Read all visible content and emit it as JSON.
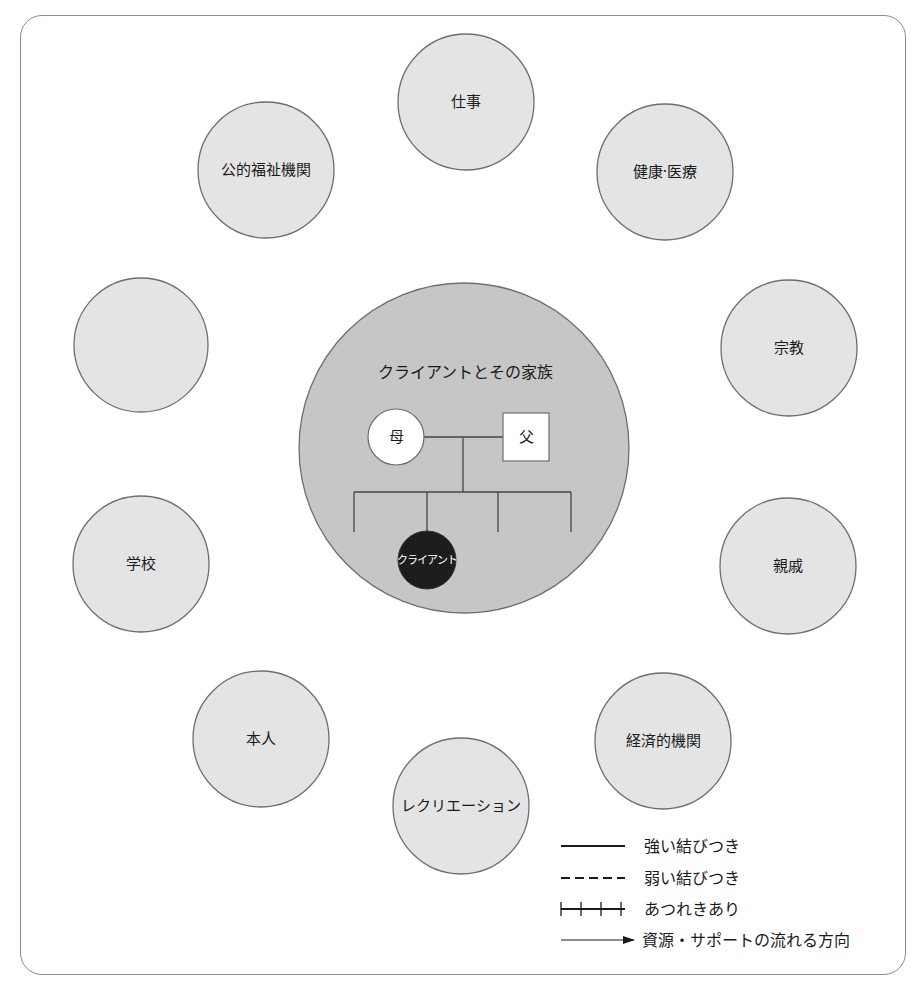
{
  "diagram": {
    "type": "ecomap",
    "colors": {
      "outer_node_fill": "#e4e4e4",
      "center_fill": "#c6c6c6",
      "stroke": "#6e6e6e",
      "client_fill": "#1c1c1c",
      "family_box_fill": "#ffffff"
    },
    "nodes": [
      {
        "id": "work",
        "label": "仕事",
        "cx": 466,
        "cy": 102,
        "r": 68
      },
      {
        "id": "health",
        "label": "健康·医療",
        "cx": 665,
        "cy": 172,
        "r": 68
      },
      {
        "id": "religion",
        "label": "宗教",
        "cx": 789,
        "cy": 348,
        "r": 68
      },
      {
        "id": "relatives",
        "label": "親戚",
        "cx": 788,
        "cy": 566,
        "r": 68
      },
      {
        "id": "economic",
        "label": "経済的機関",
        "cx": 663,
        "cy": 741,
        "r": 68
      },
      {
        "id": "recreation",
        "label": "レクリエーション",
        "cx": 461,
        "cy": 806,
        "r": 68
      },
      {
        "id": "self",
        "label": "本人",
        "cx": 261,
        "cy": 739,
        "r": 68
      },
      {
        "id": "school",
        "label": "学校",
        "cx": 141,
        "cy": 564,
        "r": 68
      },
      {
        "id": "empty",
        "label": "",
        "cx": 141,
        "cy": 345,
        "r": 67
      },
      {
        "id": "welfare",
        "label": "公的福祉機関",
        "cx": 266,
        "cy": 170,
        "r": 68
      }
    ],
    "center": {
      "title": "クライアントとその家族",
      "cx": 464,
      "cy": 448,
      "r": 165,
      "mother": {
        "label": "母",
        "cx": 396,
        "cy": 437,
        "r": 28
      },
      "father": {
        "label": "父",
        "x": 503,
        "y": 413,
        "w": 46,
        "h": 48
      },
      "client": {
        "label": "クライアント",
        "cx": 427,
        "cy": 560,
        "r": 29
      }
    }
  },
  "legend": {
    "items": [
      {
        "style": "solid",
        "label": "強い結びつき"
      },
      {
        "style": "dashed",
        "label": "弱い結びつき"
      },
      {
        "style": "ticked",
        "label": "あつれきあり"
      },
      {
        "style": "arrow",
        "label": "資源・サポートの流れる方向"
      }
    ]
  }
}
